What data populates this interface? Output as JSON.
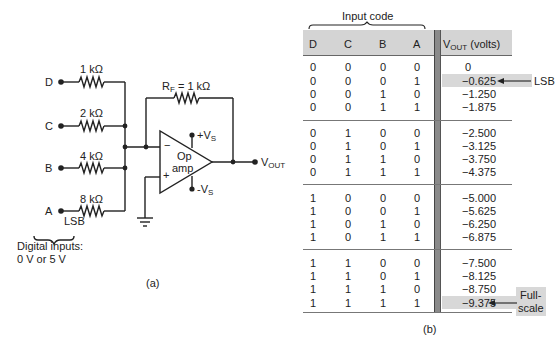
{
  "figure_a": {
    "caption": "(a)",
    "inputs": [
      {
        "label": "D",
        "resistor": "1 kΩ"
      },
      {
        "label": "C",
        "resistor": "2 kΩ"
      },
      {
        "label": "B",
        "resistor": "4 kΩ"
      },
      {
        "label": "A",
        "resistor": "8 kΩ"
      }
    ],
    "lsb_label": "LSB",
    "digital_inputs_line1": "Digital inputs:",
    "digital_inputs_line2": "0 V or 5 V",
    "feedback_resistor_prefix": "R",
    "feedback_resistor_sub": "F",
    "feedback_resistor_value": " = 1 kΩ",
    "opamp_line1": "Op",
    "opamp_line2": "amp",
    "minus_sign": "−",
    "plus_sign": "+",
    "vs_pos_prefix": "+V",
    "vs_neg_prefix": "-V",
    "vs_sub": "S",
    "vout_prefix": "V",
    "vout_sub": "OUT"
  },
  "figure_b": {
    "caption": "(b)",
    "input_code_label": "Input code",
    "headers": [
      "D",
      "C",
      "B",
      "A"
    ],
    "vout_header_prefix": "V",
    "vout_header_sub": "OUT",
    "vout_header_suffix": " (volts)",
    "rows": [
      [
        "0",
        "0",
        "0",
        "0",
        "0"
      ],
      [
        "0",
        "0",
        "0",
        "1",
        "−0.625"
      ],
      [
        "0",
        "0",
        "1",
        "0",
        "−1.250"
      ],
      [
        "0",
        "0",
        "1",
        "1",
        "−1.875"
      ],
      [
        "0",
        "1",
        "0",
        "0",
        "−2.500"
      ],
      [
        "0",
        "1",
        "0",
        "1",
        "−3.125"
      ],
      [
        "0",
        "1",
        "1",
        "0",
        "−3.750"
      ],
      [
        "0",
        "1",
        "1",
        "1",
        "−4.375"
      ],
      [
        "1",
        "0",
        "0",
        "0",
        "−5.000"
      ],
      [
        "1",
        "0",
        "0",
        "1",
        "−5.625"
      ],
      [
        "1",
        "0",
        "1",
        "0",
        "−6.250"
      ],
      [
        "1",
        "0",
        "1",
        "1",
        "−6.875"
      ],
      [
        "1",
        "1",
        "0",
        "0",
        "−7.500"
      ],
      [
        "1",
        "1",
        "0",
        "1",
        "−8.125"
      ],
      [
        "1",
        "1",
        "1",
        "0",
        "−8.750"
      ],
      [
        "1",
        "1",
        "1",
        "1",
        "−9.375"
      ]
    ],
    "lsb_annotation": "LSB",
    "fullscale_line1": "Full-",
    "fullscale_line2": "scale",
    "highlight_color": "#d8d8d8",
    "divider_color": "#8a8a8a"
  }
}
